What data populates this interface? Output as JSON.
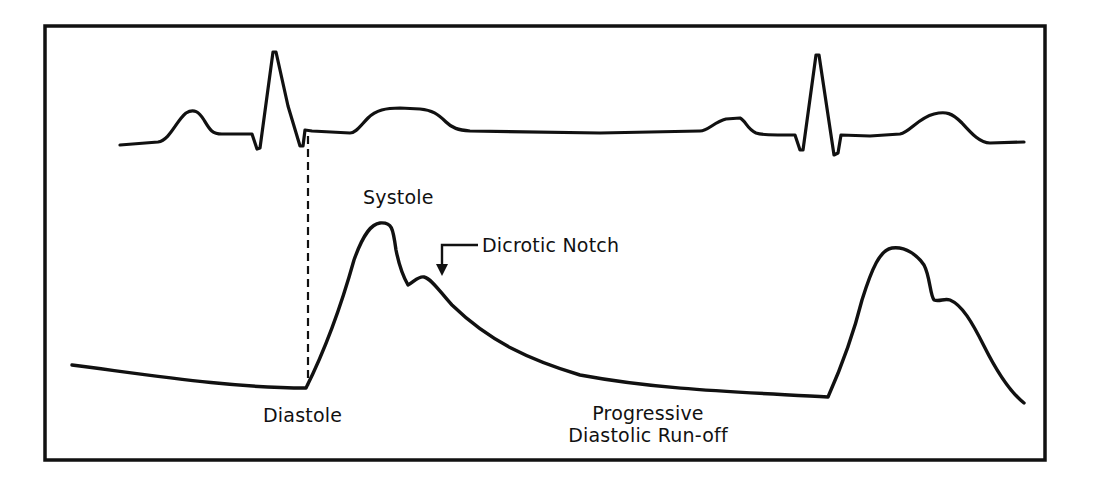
{
  "figure": {
    "colors": {
      "line": "#111111",
      "background": "#ffffff"
    },
    "labels": {
      "systole": "Systole",
      "dicrotic_notch": "Dicrotic Notch",
      "diastole": "Diastole",
      "runoff_line1": "Progressive",
      "runoff_line2": "Diastolic Run-off"
    },
    "traces": [
      {
        "name": "ECG",
        "description": "Electrocardiogram trace with P, QRS, T waves (two cardiac cycles)"
      },
      {
        "name": "Arterial pressure",
        "description": "Arterial pressure waveform with systolic peak, dicrotic notch and diastolic run-off"
      }
    ],
    "markers": [
      {
        "name": "QRS-to-upstroke alignment",
        "style": "dashed vertical line"
      }
    ]
  }
}
